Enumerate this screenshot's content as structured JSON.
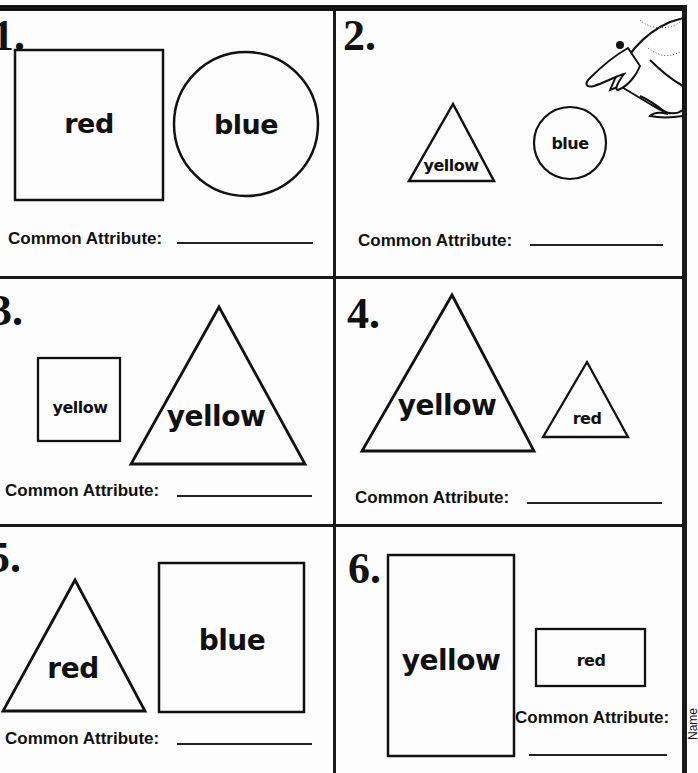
{
  "worksheet": {
    "attribute_label": "Common Attribute:",
    "side_label": "Name",
    "mascot": "goose-illustration",
    "problems": [
      {
        "number": "1.",
        "shapes": [
          {
            "shape": "square",
            "label": "red",
            "size": "large"
          },
          {
            "shape": "circle",
            "label": "blue",
            "size": "large"
          }
        ]
      },
      {
        "number": "2.",
        "shapes": [
          {
            "shape": "triangle",
            "label": "yellow",
            "size": "small"
          },
          {
            "shape": "circle",
            "label": "blue",
            "size": "small"
          }
        ]
      },
      {
        "number": "3.",
        "shapes": [
          {
            "shape": "square",
            "label": "yellow",
            "size": "small"
          },
          {
            "shape": "triangle",
            "label": "yellow",
            "size": "large"
          }
        ]
      },
      {
        "number": "4.",
        "shapes": [
          {
            "shape": "triangle",
            "label": "yellow",
            "size": "large"
          },
          {
            "shape": "triangle",
            "label": "red",
            "size": "small"
          }
        ]
      },
      {
        "number": "5.",
        "shapes": [
          {
            "shape": "triangle",
            "label": "red",
            "size": "large"
          },
          {
            "shape": "square",
            "label": "blue",
            "size": "large"
          }
        ]
      },
      {
        "number": "6.",
        "shapes": [
          {
            "shape": "rectangle",
            "label": "yellow",
            "size": "large"
          },
          {
            "shape": "rectangle",
            "label": "red",
            "size": "small"
          }
        ]
      }
    ]
  }
}
